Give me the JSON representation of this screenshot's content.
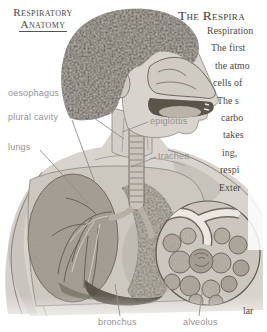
{
  "page_header": {
    "line1": "Respiratory",
    "line2": "Anatomy"
  },
  "article": {
    "title": "The Respira",
    "lines": [
      "Respiration",
      "The first",
      "the atmo",
      "cells of",
      "The s",
      "carbo",
      "takes",
      "ing,",
      "respi",
      "Exter"
    ],
    "partial_bottom": "lar"
  },
  "labels": {
    "oesophagus": "oesophagus",
    "plural_cavity": "plural cavity",
    "lungs": "lungs",
    "epiglottis": "epiglottis",
    "trachea": "trachea",
    "bronchus": "bronchus",
    "alveolus": "alveolus"
  },
  "colors": {
    "paper": "#ffffff",
    "ink": "#46453f",
    "label_gray": "#949390",
    "skin": "#d8d4cd",
    "hair": "#453f35",
    "lung_dark": "#756e62",
    "lung_light": "#a7a197"
  }
}
